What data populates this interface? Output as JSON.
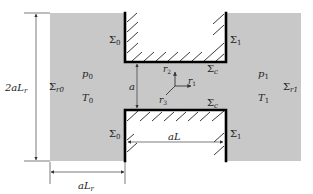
{
  "diagram": {
    "type": "geometry-schematic",
    "colors": {
      "domain_fill": "#c8c8c8",
      "wall": "#000000",
      "hatch": "#222222",
      "dimension": "#444444",
      "text": "#222222"
    },
    "regions": {
      "left_reservoir": {
        "pressure": "p",
        "pressure_sub": "0",
        "temperature": "T",
        "temperature_sub": "0"
      },
      "right_reservoir": {
        "pressure": "p",
        "pressure_sub": "1",
        "temperature": "T",
        "temperature_sub": "1"
      }
    },
    "boundaries": {
      "sigma0_top": {
        "symbol": "Σ",
        "sub": "0"
      },
      "sigma0_bottom": {
        "symbol": "Σ",
        "sub": "0"
      },
      "sigma1_top": {
        "symbol": "Σ",
        "sub": "1"
      },
      "sigma1_bottom": {
        "symbol": "Σ",
        "sub": "1"
      },
      "sigmac_top": {
        "symbol": "Σ",
        "sub": "c"
      },
      "sigmac_bottom": {
        "symbol": "Σ",
        "sub": "c"
      },
      "sigma_r0": {
        "symbol": "Σ",
        "sub": "r0"
      },
      "sigma_r1": {
        "symbol": "Σ",
        "sub": "r1"
      }
    },
    "axes": {
      "r1": {
        "label": "r",
        "sub": "1"
      },
      "r2": {
        "label": "r",
        "sub": "2"
      },
      "r3": {
        "label": "r",
        "sub": "3"
      }
    },
    "dimensions": {
      "height_reservoir": {
        "prefix": "2a",
        "var": "L",
        "sub": "r"
      },
      "channel_gap": {
        "var": "a"
      },
      "channel_length": {
        "prefix": "a",
        "var": "L"
      },
      "width_reservoir": {
        "prefix": "a",
        "var": "L",
        "sub": "r"
      }
    }
  }
}
